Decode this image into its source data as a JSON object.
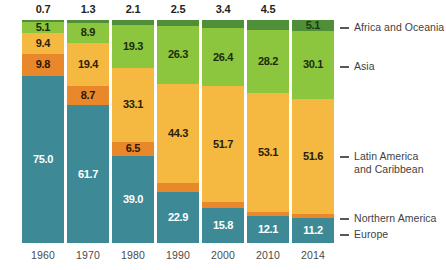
{
  "chart_data": {
    "type": "bar",
    "subtype": "stacked-100-percent",
    "title": "",
    "subtitle": "",
    "xlabel": "",
    "ylabel": "",
    "ylim": [
      0,
      100
    ],
    "grid": false,
    "legend_position": "right",
    "categories": [
      "1960",
      "1970",
      "1980",
      "1990",
      "2000",
      "2010",
      "2014"
    ],
    "series": [
      {
        "name": "Africa and Oceania",
        "color": "#4f8f38",
        "values": [
          0.7,
          1.3,
          2.1,
          2.5,
          3.4,
          4.5,
          5.1
        ],
        "labels": [
          "0.7",
          "1.3",
          "2.1",
          "2.5",
          "3.4",
          "4.5",
          "5.1"
        ]
      },
      {
        "name": "Asia",
        "color": "#8cc63e",
        "values": [
          5.1,
          8.9,
          19.3,
          26.3,
          26.4,
          28.2,
          30.1
        ],
        "labels": [
          "5.1",
          "8.9",
          "19.3",
          "26.3",
          "26.4",
          "28.2",
          "30.1"
        ]
      },
      {
        "name": "Latin America and Caribbean",
        "color": "#f5b942",
        "values": [
          9.4,
          19.4,
          33.1,
          44.3,
          51.7,
          53.1,
          51.6
        ],
        "labels": [
          "9.4",
          "19.4",
          "33.1",
          "44.3",
          "51.7",
          "53.1",
          "51.6"
        ]
      },
      {
        "name": "Northern America",
        "color": "#e8882a",
        "values": [
          9.8,
          8.7,
          6.5,
          4.0,
          2.7,
          2.0,
          1.9
        ],
        "labels": [
          "9.8",
          "8.7",
          "6.5",
          "4.0",
          "2.7",
          "2",
          "1.9"
        ]
      },
      {
        "name": "Europe",
        "color": "#3d8a96",
        "values": [
          75.0,
          61.7,
          39.0,
          22.9,
          15.8,
          12.1,
          11.2
        ],
        "labels": [
          "75.0",
          "61.7",
          "39.0",
          "22.9",
          "15.8",
          "12.1",
          "11.2"
        ]
      }
    ]
  },
  "axis": {
    "ticks": [
      "1960",
      "1970",
      "1980",
      "1990",
      "2000",
      "2010",
      "2014"
    ]
  },
  "legend": {
    "items": [
      {
        "label": "Africa and Oceania",
        "line2": "",
        "color": "#4f8f38"
      },
      {
        "label": "Asia",
        "line2": "",
        "color": "#8cc63e"
      },
      {
        "label": "Latin America",
        "line2": "and Caribbean",
        "color": "#f5b942"
      },
      {
        "label": "Northern America",
        "line2": "",
        "color": "#e8882a"
      },
      {
        "label": "Europe",
        "line2": "",
        "color": "#3d8a96"
      }
    ]
  },
  "totals_above_bar": {
    "note": "Africa and Oceania value is printed above the bar for 1960-2000 and inside the dark green segment for 2010 and 2014",
    "values": [
      "0.7",
      "1.3",
      "2.1",
      "2.5",
      "3.4"
    ]
  }
}
